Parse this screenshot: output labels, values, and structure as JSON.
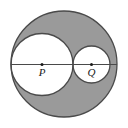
{
  "figure": {
    "background_color": "#ffffff",
    "shaded_color": "#9a9a9a",
    "unshaded_color": "#ffffff",
    "stroke_color": "#4a4a4a",
    "label_color": "#1a1a1a",
    "stroke_width": 1.3
  },
  "shapes": {
    "outer_circle": {
      "name": "outer-circle",
      "cx": 64,
      "cy": 64,
      "r": 53,
      "fill": "#9a9a9a",
      "shaded": true
    },
    "left_circle": {
      "name": "left-inner-circle",
      "cx": 42,
      "cy": 64.5,
      "r": 31,
      "fill": "#ffffff",
      "shaded": false
    },
    "right_circle": {
      "name": "right-inner-circle",
      "cx": 91.5,
      "cy": 64.5,
      "r": 18.5,
      "fill": "#ffffff",
      "shaded": false
    },
    "diameter_line": {
      "name": "horizontal-diameter-line",
      "x1": 11,
      "y1": 64.5,
      "x2": 117,
      "y2": 64.5
    }
  },
  "points": [
    {
      "id": "P",
      "label": "P",
      "cx": 42,
      "cy": 64.5,
      "dot_r": 1.5,
      "label_x": 42,
      "label_y": 76
    },
    {
      "id": "Q",
      "label": "Q",
      "cx": 91.5,
      "cy": 64.5,
      "dot_r": 1.5,
      "label_x": 91.5,
      "label_y": 76
    }
  ]
}
